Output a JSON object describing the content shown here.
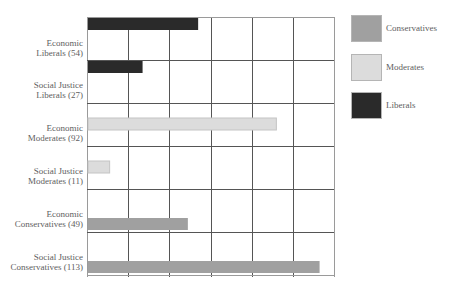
{
  "chart_data": {
    "type": "bar",
    "orientation": "horizontal",
    "title": "",
    "xlabel": "",
    "ylabel": "",
    "xlim": [
      0,
      120
    ],
    "grid": true,
    "x_gridlines": [
      0,
      20,
      40,
      60,
      80,
      100,
      120
    ],
    "tick_labels_shown": false,
    "legend_position": "right",
    "categories": [
      {
        "line1": "Economic",
        "line2": "Liberals (54)",
        "series": "Liberals",
        "value": 54
      },
      {
        "line1": "Social Justice",
        "line2": "Liberals (27)",
        "series": "Liberals",
        "value": 27
      },
      {
        "line1": "Economic",
        "line2": "Moderates (92)",
        "series": "Moderates",
        "value": 92
      },
      {
        "line1": "Social Justice",
        "line2": "Moderates (11)",
        "series": "Moderates",
        "value": 11
      },
      {
        "line1": "Economic",
        "line2": "Conservatives (49)",
        "series": "Conservatives",
        "value": 49
      },
      {
        "line1": "Social Justice",
        "line2": "Conservatives (113)",
        "series": "Conservatives",
        "value": 113
      }
    ],
    "series": [
      {
        "name": "Conservatives",
        "color": "#a0a0a0",
        "values": {
          "Economic": 49,
          "Social Justice": 113
        }
      },
      {
        "name": "Moderates",
        "color": "#dcdcdc",
        "values": {
          "Economic": 92,
          "Social Justice": 11
        }
      },
      {
        "name": "Liberals",
        "color": "#2a2a2a",
        "values": {
          "Economic": 54,
          "Social Justice": 27
        }
      }
    ],
    "legend": [
      {
        "label": "Conservatives",
        "color": "#a0a0a0"
      },
      {
        "label": "Moderates",
        "color": "#dcdcdc"
      },
      {
        "label": "Liberals",
        "color": "#2a2a2a"
      }
    ]
  }
}
